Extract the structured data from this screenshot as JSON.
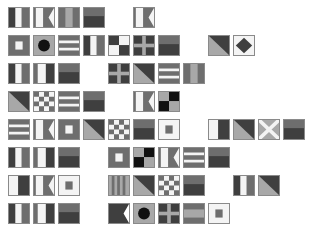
{
  "colors": {
    "background": "#ffffff",
    "dark": "#3f3f3f",
    "mid": "#6e6e6e",
    "light": "#a8a8a8",
    "white": "#f4f4f4",
    "black": "#111111",
    "border": "#8a8a8a"
  },
  "grid": {
    "origin_x": 8,
    "origin_y": 7,
    "pitch_x": 25,
    "pitch_y": 28
  },
  "rows": [
    {
      "flags": [
        {
          "col": 0,
          "type": "vtri"
        },
        {
          "col": 1,
          "type": "swallow"
        },
        {
          "col": 2,
          "type": "vtri_light"
        },
        {
          "col": 3,
          "type": "hsplit"
        },
        {
          "col": 5,
          "type": "swallow"
        }
      ]
    },
    {
      "flags": [
        {
          "col": 0,
          "type": "square_in"
        },
        {
          "col": 1,
          "type": "ball"
        },
        {
          "col": 2,
          "type": "hstripes"
        },
        {
          "col": 3,
          "type": "vtri"
        },
        {
          "col": 4,
          "type": "quarters"
        },
        {
          "col": 5,
          "type": "cross"
        },
        {
          "col": 6,
          "type": "hsplit"
        },
        {
          "col": 8,
          "type": "diag"
        },
        {
          "col": 9,
          "type": "diamond"
        }
      ]
    },
    {
      "flags": [
        {
          "col": 0,
          "type": "vtri"
        },
        {
          "col": 1,
          "type": "vtri_white"
        },
        {
          "col": 2,
          "type": "hsplit"
        },
        {
          "col": 4,
          "type": "cross"
        },
        {
          "col": 5,
          "type": "diag"
        },
        {
          "col": 6,
          "type": "hstripes"
        },
        {
          "col": 7,
          "type": "vtri_light"
        }
      ]
    },
    {
      "flags": [
        {
          "col": 0,
          "type": "diag"
        },
        {
          "col": 1,
          "type": "checker"
        },
        {
          "col": 2,
          "type": "hstripes"
        },
        {
          "col": 3,
          "type": "hsplit"
        },
        {
          "col": 5,
          "type": "swallow"
        },
        {
          "col": 6,
          "type": "quarters_black"
        }
      ]
    },
    {
      "flags": [
        {
          "col": 0,
          "type": "hstripes"
        },
        {
          "col": 1,
          "type": "swallow"
        },
        {
          "col": 2,
          "type": "square_in"
        },
        {
          "col": 3,
          "type": "diag"
        },
        {
          "col": 4,
          "type": "checker"
        },
        {
          "col": 5,
          "type": "hsplit"
        },
        {
          "col": 6,
          "type": "square_in_white"
        },
        {
          "col": 8,
          "type": "half_white"
        },
        {
          "col": 9,
          "type": "diag"
        },
        {
          "col": 10,
          "type": "saltire"
        },
        {
          "col": 11,
          "type": "hsplit"
        }
      ]
    },
    {
      "flags": [
        {
          "col": 0,
          "type": "vtri"
        },
        {
          "col": 1,
          "type": "vtri_white"
        },
        {
          "col": 2,
          "type": "hsplit"
        },
        {
          "col": 4,
          "type": "square_in"
        },
        {
          "col": 5,
          "type": "quarters_black"
        },
        {
          "col": 6,
          "type": "swallow"
        },
        {
          "col": 7,
          "type": "hstripes"
        },
        {
          "col": 8,
          "type": "hsplit"
        }
      ]
    },
    {
      "flags": [
        {
          "col": 0,
          "type": "half_white"
        },
        {
          "col": 1,
          "type": "swallow"
        },
        {
          "col": 2,
          "type": "square_in_white"
        },
        {
          "col": 4,
          "type": "vstripes"
        },
        {
          "col": 5,
          "type": "diag"
        },
        {
          "col": 6,
          "type": "checker"
        },
        {
          "col": 7,
          "type": "hsplit"
        },
        {
          "col": 9,
          "type": "vtri"
        },
        {
          "col": 10,
          "type": "diag"
        }
      ]
    },
    {
      "flags": [
        {
          "col": 0,
          "type": "vtri"
        },
        {
          "col": 1,
          "type": "vtri_white"
        },
        {
          "col": 2,
          "type": "hsplit"
        },
        {
          "col": 4,
          "type": "swallow_dark"
        },
        {
          "col": 5,
          "type": "ball"
        },
        {
          "col": 6,
          "type": "cross"
        },
        {
          "col": 7,
          "type": "hband"
        },
        {
          "col": 8,
          "type": "square_in_white"
        }
      ]
    }
  ]
}
